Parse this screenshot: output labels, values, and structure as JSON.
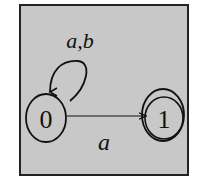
{
  "diagram": {
    "type": "finite-automaton",
    "colors": {
      "background": "#c8c8c8",
      "frame": "#222222",
      "stroke": "#111111",
      "page": "#ffffff"
    },
    "states": [
      {
        "id": "0",
        "label": "0",
        "accepting": false
      },
      {
        "id": "1",
        "label": "1",
        "accepting": true
      }
    ],
    "transitions": [
      {
        "from": "0",
        "to": "0",
        "label": "a,b",
        "kind": "self-loop"
      },
      {
        "from": "0",
        "to": "1",
        "label": "a",
        "kind": "straight"
      }
    ]
  }
}
